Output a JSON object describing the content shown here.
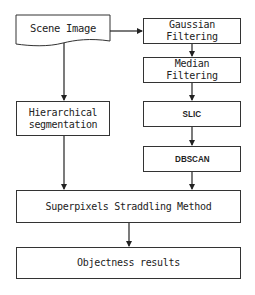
{
  "diagram": {
    "type": "flowchart",
    "nodes": [
      {
        "id": "scene",
        "label": "Scene Image",
        "shape": "document"
      },
      {
        "id": "gauss",
        "label": "Gaussian\nFiltering",
        "shape": "rect"
      },
      {
        "id": "median",
        "label": "Median\nFiltering",
        "shape": "rect"
      },
      {
        "id": "slic",
        "label": "SLIC",
        "shape": "rect"
      },
      {
        "id": "dbscan",
        "label": "DBSCAN",
        "shape": "rect"
      },
      {
        "id": "hier",
        "label": "Hierarchical\nsegmentation",
        "shape": "rect"
      },
      {
        "id": "straddle",
        "label": "Superpixels Straddling Method",
        "shape": "rect"
      },
      {
        "id": "objectness",
        "label": "Objectness results",
        "shape": "rect"
      }
    ],
    "edges": [
      {
        "from": "scene",
        "to": "gauss"
      },
      {
        "from": "gauss",
        "to": "median"
      },
      {
        "from": "median",
        "to": "slic"
      },
      {
        "from": "slic",
        "to": "dbscan"
      },
      {
        "from": "dbscan",
        "to": "straddle"
      },
      {
        "from": "scene",
        "to": "hier"
      },
      {
        "from": "hier",
        "to": "straddle"
      },
      {
        "from": "straddle",
        "to": "objectness"
      }
    ]
  },
  "labels": {
    "scene": "Scene Image",
    "gauss": "Gaussian\nFiltering",
    "median": "Median\nFiltering",
    "slic": "SLIC",
    "dbscan": "DBSCAN",
    "hier": "Hierarchical\nsegmentation",
    "straddle": "Superpixels Straddling Method",
    "objectness": "Objectness results"
  },
  "colors": {
    "stroke": "#333333",
    "background": "#ffffff"
  }
}
